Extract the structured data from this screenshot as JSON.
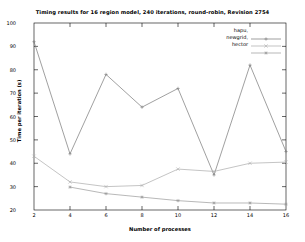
{
  "chart_data": {
    "type": "line",
    "title": "Timing results for 16 region model, 240 iterations, round-robin, Revision 2754",
    "xlabel": "Number of processes",
    "ylabel": "Time per iteration (s)",
    "x": [
      2,
      4,
      6,
      8,
      10,
      12,
      14,
      16
    ],
    "xlim": [
      2,
      16
    ],
    "ylim": [
      20,
      100
    ],
    "xticks": [
      "2",
      "4",
      "6",
      "8",
      "10",
      "12",
      "14",
      "16"
    ],
    "yticks": [
      "100",
      "90",
      "80",
      "70",
      "60",
      "50",
      "40",
      "30",
      "20"
    ],
    "grid": false,
    "legend_position": "top-right",
    "series": [
      {
        "name": "hapu,",
        "color": "#777777",
        "marker": "plus",
        "x": [
          2,
          4,
          6,
          8,
          10,
          12,
          14,
          16
        ],
        "values": [
          92.0,
          44.0,
          78.0,
          64.0,
          72.0,
          35.0,
          82.0,
          45.0
        ]
      },
      {
        "name": "newgrid,",
        "color": "#aaaaaa",
        "marker": "cross",
        "x": [
          2,
          4,
          6,
          8,
          10,
          12,
          14,
          16
        ],
        "values": [
          43.0,
          32.0,
          30.0,
          30.5,
          37.5,
          36.5,
          40.0,
          40.5
        ]
      },
      {
        "name": "hector",
        "color": "#999999",
        "marker": "star",
        "x": [
          4,
          6,
          8,
          10,
          12,
          14,
          16
        ],
        "values": [
          29.8,
          27.0,
          25.5,
          24.0,
          23.0,
          23.0,
          22.5
        ]
      }
    ]
  },
  "legend": {
    "items": [
      {
        "label": "hapu,"
      },
      {
        "label": "newgrid,"
      },
      {
        "label": "hector"
      }
    ]
  }
}
